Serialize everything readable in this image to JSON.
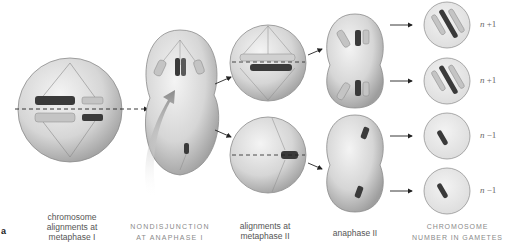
{
  "figure": {
    "panel_letter": "a",
    "stages": [
      {
        "id": "metaphase-i",
        "label_lines": [
          "chromosome",
          "alignments at",
          "metaphase I"
        ]
      },
      {
        "id": "anaphase-i",
        "label_lines": [
          "NONDISJUNCTION",
          "AT ANAPHASE I"
        ]
      },
      {
        "id": "metaphase-ii",
        "label_lines": [
          "alignments at",
          "metaphase II"
        ]
      },
      {
        "id": "anaphase-ii",
        "label_lines": [
          "anaphase II"
        ]
      },
      {
        "id": "gametes",
        "label_lines": [
          "CHROMOSOME",
          "NUMBER IN GAMETES"
        ]
      }
    ],
    "gametes": [
      {
        "n_label": "n",
        "suffix": " +1"
      },
      {
        "n_label": "n",
        "suffix": " +1"
      },
      {
        "n_label": "n",
        "suffix": " −1"
      },
      {
        "n_label": "n",
        "suffix": " −1"
      }
    ],
    "colors": {
      "cell_fill": "#d9d9d9",
      "cell_edge": "#8c8c8c",
      "dark_chromosome": "#3a3a3a",
      "light_chromosome": "#c8c8c8",
      "arrow": "#222222",
      "big_arrow": "#9a9a9a"
    }
  }
}
